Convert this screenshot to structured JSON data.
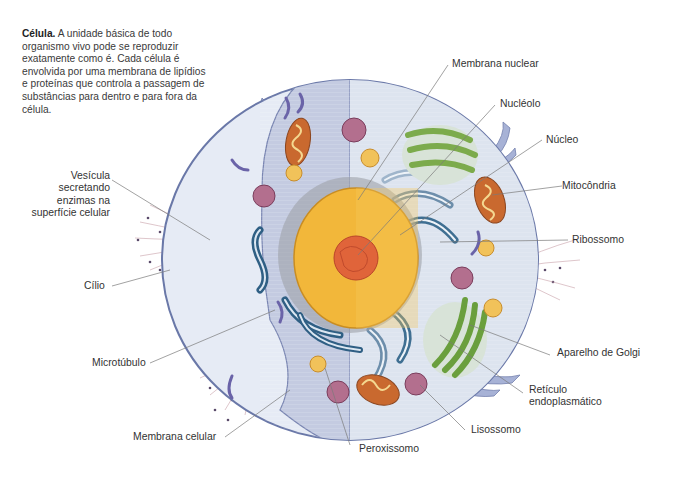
{
  "intro": {
    "title": "Célula.",
    "text": " A unidade básica de todo organismo vivo pode se reproduzir exatamente como é. Cada célula é envolvida por uma membrana de lipídios e proteínas que controla a passagem de substâncias para dentro e para fora da célula."
  },
  "labels": {
    "membrana_nuclear": "Membrana nuclear",
    "nucleolo": "Nucléolo",
    "nucleo": "Núcleo",
    "mitocondria": "Mitocôndria",
    "ribossomo": "Ribossomo",
    "vesicula_l1": "Vesícula",
    "vesicula_l2": "secretando",
    "vesicula_l3": "enzimas na",
    "vesicula_l4": "superfície celular",
    "cilio": "Cílio",
    "microtubulo": "Microtúbulo",
    "aparelho_golgi": "Aparelho de Golgi",
    "reticulo_l1": "Retículo",
    "reticulo_l2": "endoplasmático",
    "lisossomo": "Lisossomo",
    "membrana_celular": "Membrana celular",
    "peroxissomo": "Peroxissomo"
  },
  "colors": {
    "cytoplasm_outer": "#e6ebf5",
    "cytoplasm_inner": "#c9d0e4",
    "membrane": "#6a78a8",
    "nucleus": "#f2b73a",
    "nucleolus": "#e0643a",
    "golgi": "#7cab4c",
    "er": "#3f6f92",
    "mitochondria": "#c9692f",
    "lysosome": "#b36f8e",
    "peroxisome": "#f1c25a",
    "leader_line": "#7a7a7a"
  }
}
